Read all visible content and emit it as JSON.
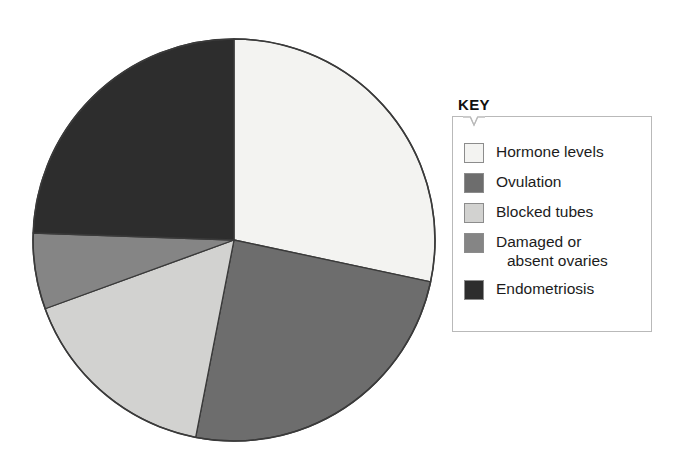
{
  "legend": {
    "title": "KEY",
    "items": [
      {
        "label": "Hormone levels",
        "label_line2": "",
        "color": "#f3f3f1"
      },
      {
        "label": "Ovulation",
        "label_line2": "",
        "color": "#6d6d6d"
      },
      {
        "label": "Blocked tubes",
        "label_line2": "",
        "color": "#d2d2d0"
      },
      {
        "label": "Damaged or",
        "label_line2": "absent ovaries",
        "color": "#858585"
      },
      {
        "label": "Endometriosis",
        "label_line2": "",
        "color": "#2d2d2d"
      }
    ]
  },
  "chart_data": {
    "type": "pie",
    "title": "",
    "legend_title": "KEY",
    "legend_position": "right",
    "labels": [
      "Hormone levels",
      "Ovulation",
      "Blocked tubes",
      "Damaged or absent ovaries",
      "Endometriosis"
    ],
    "values": [
      28,
      25,
      16,
      6,
      25
    ],
    "unit": "percent",
    "angles_deg": [
      102,
      89,
      59,
      22,
      88
    ],
    "start_angle_deg": 0,
    "direction": "clockwise",
    "colors": [
      "#f3f3f1",
      "#6d6d6d",
      "#d2d2d0",
      "#858585",
      "#2d2d2d"
    ],
    "stroke": "#3a3a3a",
    "center": [
      234,
      240
    ],
    "radius": 201,
    "xlabel": "",
    "ylabel": "",
    "grid": false
  }
}
